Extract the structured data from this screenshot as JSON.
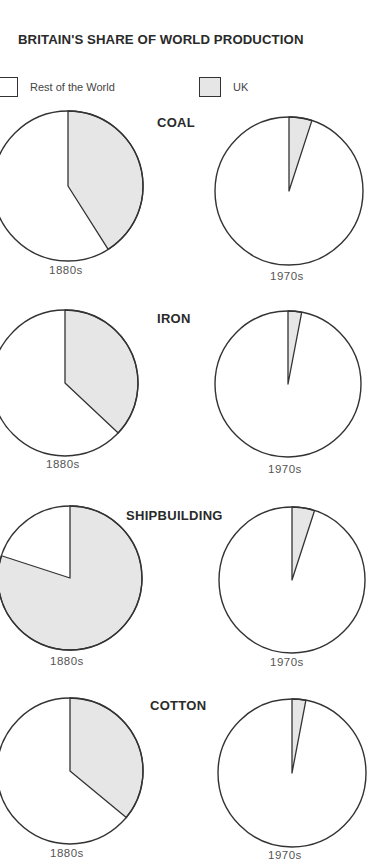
{
  "title": "BRITAIN'S SHARE OF WORLD PRODUCTION",
  "legend": [
    {
      "label": "Rest of the World",
      "color": "#ffffff"
    },
    {
      "label": "UK",
      "color": "#e6e6e6"
    }
  ],
  "sections": [
    {
      "category": "COAL",
      "periods": [
        "1880s",
        "1970s"
      ]
    },
    {
      "category": "IRON",
      "periods": [
        "1880s",
        "1970s"
      ]
    },
    {
      "category": "SHIPBUILDING",
      "periods": [
        "1880s",
        "1970s"
      ]
    },
    {
      "category": "COTTON",
      "periods": [
        "1880s",
        "1970s"
      ]
    }
  ],
  "chart_data": {
    "type": "pie",
    "title": "BRITAIN'S SHARE OF WORLD PRODUCTION",
    "legend": [
      "Rest of the World",
      "UK"
    ],
    "legend_position": "top",
    "categories": [
      "COAL",
      "IRON",
      "SHIPBUILDING",
      "COTTON"
    ],
    "periods": [
      "1880s",
      "1970s"
    ],
    "series": [
      {
        "name": "UK share 1880s (%)",
        "values": [
          41,
          37,
          80,
          36
        ]
      },
      {
        "name": "UK share 1970s (%)",
        "values": [
          5,
          3,
          5,
          3
        ]
      }
    ],
    "pies": [
      {
        "category": "COAL",
        "period": "1880s",
        "UK": 41,
        "Rest of the World": 59
      },
      {
        "category": "COAL",
        "period": "1970s",
        "UK": 5,
        "Rest of the World": 95
      },
      {
        "category": "IRON",
        "period": "1880s",
        "UK": 37,
        "Rest of the World": 63
      },
      {
        "category": "IRON",
        "period": "1970s",
        "UK": 3,
        "Rest of the World": 97
      },
      {
        "category": "SHIPBUILDING",
        "period": "1880s",
        "UK": 80,
        "Rest of the World": 20
      },
      {
        "category": "SHIPBUILDING",
        "period": "1970s",
        "UK": 5,
        "Rest of the World": 95
      },
      {
        "category": "COTTON",
        "period": "1880s",
        "UK": 36,
        "Rest of the World": 64
      },
      {
        "category": "COTTON",
        "period": "1970s",
        "UK": 3,
        "Rest of the World": 97
      }
    ]
  }
}
